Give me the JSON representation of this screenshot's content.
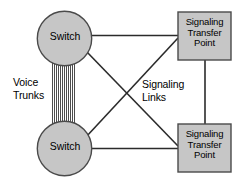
{
  "diagram": {
    "type": "network-topology",
    "background_color": "#ffffff",
    "stroke_color": "#2b2b2b",
    "node_fill_color": "#c6c6c6",
    "node_border_color": "#4a4a4a",
    "nodes": [
      {
        "id": "switch-top",
        "shape": "circle",
        "label": "Switch",
        "cx": 64.5,
        "cy": 38.5,
        "r": 27.5
      },
      {
        "id": "switch-bottom",
        "shape": "circle",
        "label": "Switch",
        "cx": 64.5,
        "cy": 148.5,
        "r": 27.5
      },
      {
        "id": "stp-top",
        "shape": "rectangle",
        "label": "Signaling\nTransfer\nPoint",
        "x": 178,
        "y": 12,
        "width": 53,
        "height": 48
      },
      {
        "id": "stp-bottom",
        "shape": "rectangle",
        "label": "Signaling\nTransfer\nPoint",
        "x": 178,
        "y": 124,
        "width": 53,
        "height": 48
      }
    ],
    "annotations": [
      {
        "id": "voice-trunks",
        "label": "Voice\nTrunks"
      },
      {
        "id": "signaling-links",
        "label": "Signaling\nLinks"
      }
    ],
    "links": [
      {
        "id": "link-switch-top-to-stp-top",
        "from": "switch-top",
        "to": "stp-top",
        "style": "solid",
        "kind": "signaling"
      },
      {
        "id": "link-switch-top-to-stp-bottom",
        "from": "switch-top",
        "to": "stp-bottom",
        "style": "solid",
        "kind": "signaling"
      },
      {
        "id": "link-switch-bottom-to-stp-top",
        "from": "switch-bottom",
        "to": "stp-top",
        "style": "solid",
        "kind": "signaling"
      },
      {
        "id": "link-switch-bottom-to-stp-bottom",
        "from": "switch-bottom",
        "to": "stp-bottom",
        "style": "solid",
        "kind": "signaling"
      },
      {
        "id": "link-stp-top-to-stp-bottom",
        "from": "stp-top",
        "to": "stp-bottom",
        "style": "solid",
        "kind": "signaling"
      },
      {
        "id": "link-voice-trunk-bundle",
        "from": "switch-top",
        "to": "switch-bottom",
        "style": "bundle",
        "kind": "voice-trunks",
        "strand_count": 12
      }
    ]
  },
  "labels": {
    "switch_top": "Switch",
    "switch_bottom": "Switch",
    "stp_top": "Signaling\nTransfer\nPoint",
    "stp_bottom": "Signaling\nTransfer\nPoint",
    "voice_trunks": "Voice\nTrunks",
    "signaling_links": "Signaling\nLinks"
  }
}
